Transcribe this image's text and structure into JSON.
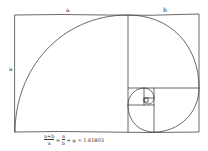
{
  "diagram": {
    "labels": {
      "top_a": "a",
      "top_b": "b",
      "side_a": "a"
    },
    "formula": "a+b / a = a / b = φ ≈ 1.61803",
    "formula_parts": {
      "lhs_num": "a+b",
      "lhs_den": "a",
      "mid_num": "a",
      "mid_den": "b",
      "rhs": "= φ ≈ 1.61803"
    },
    "stroke_color": "#444444",
    "background": "#ffffff"
  }
}
